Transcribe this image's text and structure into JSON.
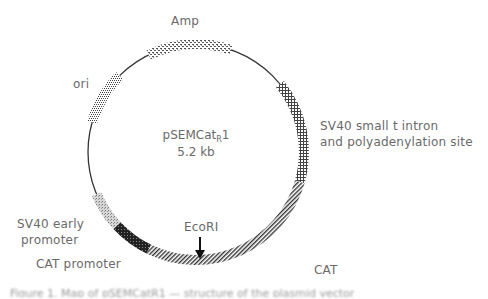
{
  "plasmid": {
    "name_prefix": "pSEMCat",
    "name_subscript": "R",
    "name_suffix": "1",
    "size": "5.2 kb"
  },
  "features": [
    {
      "id": "amp",
      "label": "Amp",
      "pattern": "dense-dots",
      "start_deg": -116,
      "end_deg": -71
    },
    {
      "id": "ori",
      "label": "ori",
      "pattern": "checker-dots",
      "start_deg": -164,
      "end_deg": -135
    },
    {
      "id": "sv40-intron",
      "label_line1": "SV40 small t intron",
      "label_line2": "and polyadenylation site",
      "pattern": "grid",
      "start_deg": -39,
      "end_deg": 16
    },
    {
      "id": "cat",
      "label": "CAT",
      "pattern": "diagonal-hatch",
      "start_deg": 16,
      "end_deg": 116
    },
    {
      "id": "cat-promoter",
      "label": "CAT promoter",
      "pattern": "dark-dots",
      "start_deg": 116,
      "end_deg": 137
    },
    {
      "id": "sv40-early",
      "label_line1": "SV40 early",
      "label_line2": "promoter",
      "pattern": "light-dots",
      "start_deg": 137,
      "end_deg": 157
    }
  ],
  "sites": [
    {
      "id": "ecori",
      "label": "EcoRI"
    }
  ],
  "caption": "Figure 1. Map of pSEMCatR1 — structure of the plasmid vector"
}
